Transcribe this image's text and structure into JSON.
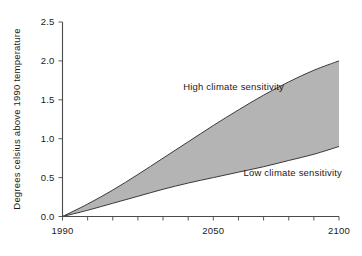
{
  "chart_data": {
    "type": "area",
    "title": "",
    "subtitle": "",
    "xlabel": "",
    "ylabel": "Degrees celsius above 1990 temperature",
    "xlim": [
      1990,
      2100
    ],
    "ylim": [
      0.0,
      2.5
    ],
    "grid": false,
    "legend_position": "inline-annotations",
    "x_ticklabels": [
      "1990",
      "2050",
      "2100"
    ],
    "x_ticklabel_values": [
      1990,
      2050,
      2100
    ],
    "x_minor_tick_step": 10,
    "y_ticklabels": [
      "0.0",
      "0.5",
      "1.0",
      "1.5",
      "2.0",
      "2.5"
    ],
    "y_ticklabel_values": [
      0.0,
      0.5,
      1.0,
      1.5,
      2.0,
      2.5
    ],
    "x": [
      1990,
      2000,
      2010,
      2020,
      2030,
      2040,
      2050,
      2060,
      2070,
      2080,
      2090,
      2100
    ],
    "series": [
      {
        "name": "High climate sensitivity",
        "values": [
          0.0,
          0.16,
          0.34,
          0.54,
          0.75,
          0.96,
          1.17,
          1.37,
          1.56,
          1.73,
          1.88,
          2.0
        ]
      },
      {
        "name": "Low climate sensitivity",
        "values": [
          0.0,
          0.08,
          0.17,
          0.26,
          0.35,
          0.43,
          0.5,
          0.57,
          0.64,
          0.72,
          0.8,
          0.9
        ]
      }
    ],
    "band_fill_color": "#b0b0b0",
    "line_color": "#3a3a3a",
    "annotations": [
      {
        "text": "High climate sensitivity",
        "x": 2038,
        "y": 1.63
      },
      {
        "text": "Low climate sensitivity",
        "x": 2062,
        "y": 0.52
      }
    ]
  },
  "accessibility": {
    "figure_role": "climate projection uncertainty band chart"
  }
}
